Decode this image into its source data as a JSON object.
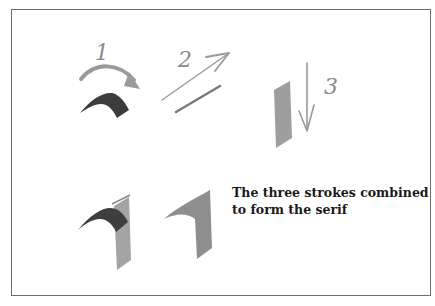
{
  "figure": {
    "step_labels": [
      "1",
      "2",
      "3"
    ],
    "caption": {
      "line1": "The three strokes combined",
      "line2": "to form the serif"
    },
    "colors": {
      "frame": "#6e6e6e",
      "arrow": "#9a9a9a",
      "dark_stroke": "#3c3c3c",
      "light_stroke": "#9e9e9e",
      "text": "#1a1a1a"
    }
  }
}
